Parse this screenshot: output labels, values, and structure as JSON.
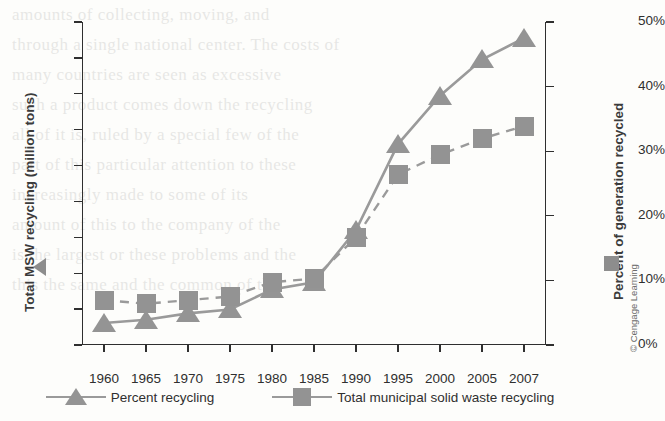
{
  "figure": {
    "left_axis_title": "Total MSW recycling (million tons)",
    "right_axis_title": "Percent of generation recycled",
    "credit": "© Cengage Learning",
    "left_key_icon": "triangle-left-pointing-icon",
    "right_key_icon": "square-icon"
  },
  "legend": {
    "items": [
      {
        "label": "Percent recycling",
        "icon": "triangle-marker-icon",
        "color": "#949494",
        "line": "solid"
      },
      {
        "label": "Total municipal solid waste recycling",
        "icon": "square-marker-icon",
        "color": "#939393",
        "line": "dashed"
      }
    ]
  },
  "chart_data": {
    "type": "line",
    "title": "",
    "xlabel": "",
    "categories": [
      "1960",
      "1965",
      "1970",
      "1975",
      "1980",
      "1985",
      "1990",
      "1995",
      "2000",
      "2005",
      "2007"
    ],
    "x_tick_labels": [
      "1960",
      "1965",
      "1970",
      "1975",
      "1980",
      "1985",
      "1990",
      "1995",
      "2000",
      "2005",
      "2007"
    ],
    "y_left": {
      "label": "Total MSW recycling (million tons)",
      "ticks": [
        0,
        10,
        20,
        30,
        40,
        50,
        60,
        70,
        80,
        90
      ],
      "tick_labels": [
        "0",
        "10",
        "20",
        "30",
        "40",
        "50",
        "60",
        "70",
        "80",
        "90"
      ],
      "ylim": [
        0,
        90
      ]
    },
    "y_right": {
      "label": "Percent of generation recycled",
      "ticks": [
        0,
        10,
        20,
        30,
        40,
        50
      ],
      "tick_labels": [
        "0%",
        "10%",
        "20%",
        "30%",
        "40%",
        "50%"
      ],
      "ylim": [
        0,
        50
      ]
    },
    "grid": false,
    "legend_position": "bottom",
    "series": [
      {
        "name": "Total municipal solid waste recycling",
        "axis": "left",
        "unit": "million tons",
        "marker": "square",
        "line_style": "dashed",
        "color": "#939393",
        "values": [
          12.5,
          11.5,
          12.5,
          13.5,
          17.5,
          18.5,
          30.0,
          47.5,
          53.0,
          57.5,
          61.0
        ]
      },
      {
        "name": "Percent recycling",
        "axis": "right",
        "unit": "%",
        "marker": "triangle",
        "line_style": "solid",
        "color": "#949494",
        "values": [
          3.4,
          3.9,
          4.9,
          5.5,
          8.6,
          9.7,
          17.8,
          31.1,
          38.6,
          44.2,
          47.5
        ]
      }
    ]
  },
  "bleed_text": [
    "amounts of collecting, moving, and",
    "through a single national center. The costs of",
    "many countries are seen as excessive",
    "such a product comes down the recycling",
    "all of it is, ruled by a special few of the",
    "part of this particular attention to these",
    "increasingly made to some of its",
    "amount of this to the company of the",
    "is the largest or these problems and the",
    "this the same and the common of the"
  ]
}
